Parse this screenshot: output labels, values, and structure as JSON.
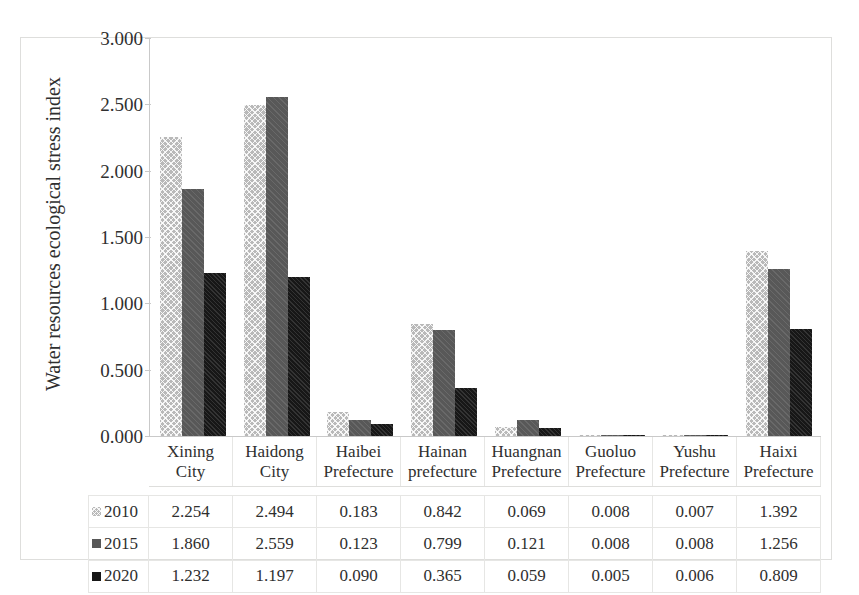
{
  "chart_data": {
    "type": "bar",
    "title": "",
    "subtitle": "",
    "xlabel": "",
    "ylabel": "Water resources ecological stress index",
    "ylim": [
      0,
      3.0
    ],
    "ytick_step": 0.5,
    "grid": false,
    "legend_position": "table-left",
    "categories": [
      "Xining City",
      "Haidong City",
      "Haibei Prefecture",
      "Hainan prefecture",
      "Huangnan Prefecture",
      "Guoluo Prefecture",
      "Yushu Prefecture",
      "Haixi Prefecture"
    ],
    "category_lines": [
      [
        "Xining",
        "City"
      ],
      [
        "Haidong",
        "City"
      ],
      [
        "Haibei",
        "Prefecture"
      ],
      [
        "Hainan",
        "prefecture"
      ],
      [
        "Huangnan",
        "Prefecture"
      ],
      [
        "Guoluo",
        "Prefecture"
      ],
      [
        "Yushu",
        "Prefecture"
      ],
      [
        "Haixi",
        "Prefecture"
      ]
    ],
    "ytick_labels": [
      "3.000",
      "2.500",
      "2.000",
      "1.500",
      "1.000",
      "0.500",
      "0.000"
    ],
    "ytick_values": [
      3.0,
      2.5,
      2.0,
      1.5,
      1.0,
      0.5,
      0.0
    ],
    "series": [
      {
        "name": "2010",
        "color": "#b9b9b9",
        "pattern": "checkered",
        "values": [
          2.254,
          2.494,
          0.183,
          0.842,
          0.069,
          0.008,
          0.007,
          1.392
        ],
        "labels": [
          "2.254",
          "2.494",
          "0.183",
          "0.842",
          "0.069",
          "0.008",
          "0.007",
          "1.392"
        ]
      },
      {
        "name": "2015",
        "color": "#585858",
        "pattern": "solid-gray",
        "values": [
          1.86,
          2.559,
          0.123,
          0.799,
          0.121,
          0.008,
          0.008,
          1.256
        ],
        "labels": [
          "1.860",
          "2.559",
          "0.123",
          "0.799",
          "0.121",
          "0.008",
          "0.008",
          "1.256"
        ]
      },
      {
        "name": "2020",
        "color": "#171717",
        "pattern": "solid-dark",
        "values": [
          1.232,
          1.197,
          0.09,
          0.365,
          0.059,
          0.005,
          0.006,
          0.809
        ],
        "labels": [
          "1.232",
          "1.197",
          "0.090",
          "0.365",
          "0.059",
          "0.005",
          "0.006",
          "0.809"
        ]
      }
    ]
  }
}
